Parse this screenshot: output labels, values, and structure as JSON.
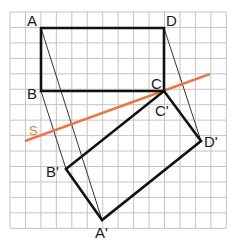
{
  "diagram": {
    "type": "geometry-reflection",
    "grid": {
      "x0": 10,
      "y0": 12,
      "step": 15.45,
      "cols": 14,
      "rows": 14,
      "color": "#c4c4c4"
    },
    "colors": {
      "shape": "#111111",
      "construction": "#333333",
      "axis": "#e8784a"
    },
    "axis_label": "S",
    "points": {
      "A": {
        "label": "A",
        "x": 41,
        "y": 28
      },
      "B": {
        "label": "B",
        "x": 41,
        "y": 91
      },
      "C": {
        "label": "C",
        "x": 164,
        "y": 91
      },
      "D": {
        "label": "D",
        "x": 164,
        "y": 28
      },
      "A_prime": {
        "label": "A'",
        "x": 102,
        "y": 220
      },
      "B_prime": {
        "label": "B'",
        "x": 66,
        "y": 169
      },
      "C_prime": {
        "label": "C'",
        "x": 164,
        "y": 91
      },
      "D_prime": {
        "label": "D'",
        "x": 201,
        "y": 141
      }
    },
    "axis_line": {
      "x1": 25,
      "y1": 141,
      "x2": 210,
      "y2": 74
    }
  }
}
